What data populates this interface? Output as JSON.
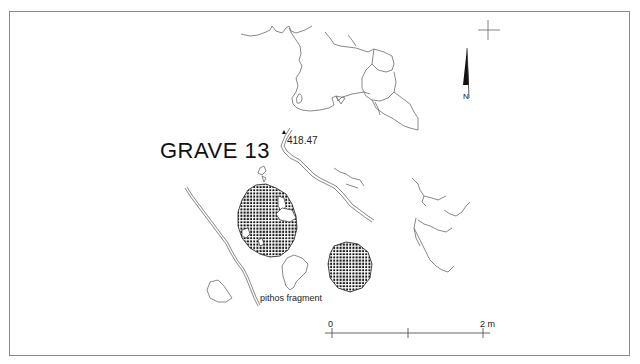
{
  "drawing": {
    "title": "GRAVE 13",
    "elevation_point": "418.47",
    "annotations": {
      "pithos_label": "pithos fragment"
    },
    "north_arrow": {
      "label": "N"
    },
    "scale_bar": {
      "start_label": "0",
      "end_label": "2 m"
    },
    "colors": {
      "line": "#555555",
      "frame": "#8a8a8a",
      "hatch": "#111111",
      "text": "#111111"
    }
  }
}
